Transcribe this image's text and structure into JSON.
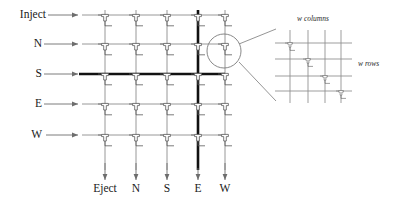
{
  "figure": {
    "type": "crossbar-switch-diagram",
    "title": ""
  },
  "main_grid": {
    "rows": 5,
    "cols": 5,
    "row_inputs": [
      {
        "label": "Inject",
        "highlighted": false
      },
      {
        "label": "N",
        "highlighted": false
      },
      {
        "label": "S",
        "highlighted": true
      },
      {
        "label": "E",
        "highlighted": false
      },
      {
        "label": "W",
        "highlighted": false
      }
    ],
    "col_outputs": [
      {
        "label": "Eject",
        "highlighted": false
      },
      {
        "label": "N",
        "highlighted": false
      },
      {
        "label": "S",
        "highlighted": false
      },
      {
        "label": "E",
        "highlighted": true
      },
      {
        "label": "W",
        "highlighted": false
      }
    ],
    "active_path": {
      "row": "S",
      "col": "E"
    },
    "switch_count": 25,
    "highlighted_switch": {
      "row_index": 1,
      "col_index": 4
    }
  },
  "inset": {
    "rows": 4,
    "cols": 4,
    "columns_label": "w columns",
    "rows_label": "w rows",
    "diagonal_switches": 4
  },
  "colors": {
    "line_thin": "#8a8a8a",
    "line_thick": "#111111",
    "switch_stroke": "#555555",
    "text": "#1a1a1a",
    "background": "#ffffff",
    "callout": "#6f6f6f"
  }
}
